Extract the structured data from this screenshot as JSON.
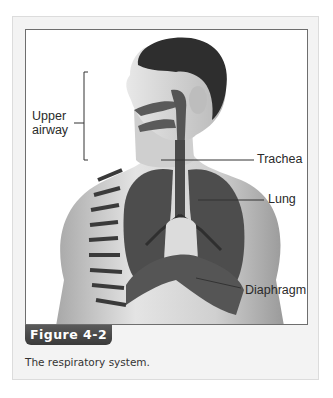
{
  "figure": {
    "tab_label": "Figure 4-2",
    "caption": "The respiratory system.",
    "labels": {
      "upper_airway_line1": "Upper",
      "upper_airway_line2": "airway",
      "trachea": "Trachea",
      "lung": "Lung",
      "diaphragm": "Diaphragm"
    },
    "colors": {
      "tab_bg": "#444444",
      "panel_bg": "#f3f3f3",
      "frame_border": "#6e6e6e"
    }
  }
}
